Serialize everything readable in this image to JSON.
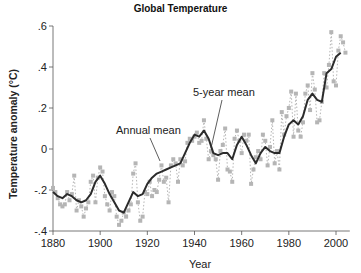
{
  "chart_data": {
    "type": "line",
    "title": "Global Temperature",
    "xlabel": "Year",
    "ylabel": "Temperature anomaly (°C)",
    "xlim": [
      1880,
      2005
    ],
    "ylim": [
      -0.4,
      0.6
    ],
    "x_ticks": [
      1880,
      1900,
      1920,
      1940,
      1960,
      1980,
      2000
    ],
    "x_tick_labels": [
      "1880",
      "1900",
      "1920",
      "1940",
      "1960",
      "1980",
      "2000"
    ],
    "y_ticks": [
      -0.4,
      -0.2,
      0,
      0.2,
      0.4,
      0.6
    ],
    "y_tick_labels": [
      "-.4",
      "-.2",
      "0",
      ".2",
      ".4",
      ".6"
    ],
    "grid": false,
    "legend": null,
    "annotations": [
      {
        "text": "Annual mean",
        "target_series": "Annual mean"
      },
      {
        "text": "5-year mean",
        "target_series": "5-year mean"
      }
    ],
    "series": [
      {
        "name": "5-year mean",
        "style": "solid dark line",
        "color": "#2b2b2b",
        "x": [
          1880,
          1882,
          1884,
          1886,
          1888,
          1890,
          1892,
          1894,
          1896,
          1898,
          1900,
          1902,
          1904,
          1906,
          1908,
          1910,
          1912,
          1914,
          1916,
          1918,
          1920,
          1922,
          1924,
          1926,
          1928,
          1930,
          1932,
          1934,
          1936,
          1938,
          1940,
          1942,
          1944,
          1946,
          1948,
          1950,
          1952,
          1954,
          1956,
          1958,
          1960,
          1962,
          1964,
          1966,
          1968,
          1970,
          1972,
          1974,
          1976,
          1978,
          1980,
          1982,
          1984,
          1986,
          1988,
          1990,
          1992,
          1994,
          1996,
          1998,
          2000,
          2002
        ],
        "values": [
          -0.21,
          -0.23,
          -0.24,
          -0.22,
          -0.23,
          -0.25,
          -0.26,
          -0.25,
          -0.22,
          -0.16,
          -0.13,
          -0.17,
          -0.22,
          -0.26,
          -0.3,
          -0.31,
          -0.26,
          -0.21,
          -0.23,
          -0.22,
          -0.17,
          -0.14,
          -0.12,
          -0.11,
          -0.1,
          -0.09,
          -0.08,
          -0.07,
          -0.02,
          0.03,
          0.07,
          0.06,
          0.09,
          0.05,
          -0.02,
          -0.03,
          -0.02,
          -0.02,
          -0.05,
          0.02,
          0.06,
          0.02,
          -0.03,
          -0.07,
          -0.02,
          0.01,
          -0.01,
          -0.02,
          -0.02,
          0.06,
          0.12,
          0.14,
          0.12,
          0.16,
          0.24,
          0.27,
          0.24,
          0.23,
          0.37,
          0.39,
          0.45,
          0.47
        ]
      },
      {
        "name": "Annual mean",
        "style": "light gray squares with dashed connectors",
        "color": "#b5b5b5",
        "x": [
          1880,
          1881,
          1882,
          1883,
          1884,
          1885,
          1886,
          1887,
          1888,
          1889,
          1890,
          1891,
          1892,
          1893,
          1894,
          1895,
          1896,
          1897,
          1898,
          1899,
          1900,
          1901,
          1902,
          1903,
          1904,
          1905,
          1906,
          1907,
          1908,
          1909,
          1910,
          1911,
          1912,
          1913,
          1914,
          1915,
          1916,
          1917,
          1918,
          1919,
          1920,
          1921,
          1922,
          1923,
          1924,
          1925,
          1926,
          1927,
          1928,
          1929,
          1930,
          1931,
          1932,
          1933,
          1934,
          1935,
          1936,
          1937,
          1938,
          1939,
          1940,
          1941,
          1942,
          1943,
          1944,
          1945,
          1946,
          1947,
          1948,
          1949,
          1950,
          1951,
          1952,
          1953,
          1954,
          1955,
          1956,
          1957,
          1958,
          1959,
          1960,
          1961,
          1962,
          1963,
          1964,
          1965,
          1966,
          1967,
          1968,
          1969,
          1970,
          1971,
          1972,
          1973,
          1974,
          1975,
          1976,
          1977,
          1978,
          1979,
          1980,
          1981,
          1982,
          1983,
          1984,
          1985,
          1986,
          1987,
          1988,
          1989,
          1990,
          1991,
          1992,
          1993,
          1994,
          1995,
          1996,
          1997,
          1998,
          1999,
          2000,
          2001,
          2002,
          2003,
          2004
        ],
        "values": [
          -0.19,
          -0.21,
          -0.24,
          -0.27,
          -0.28,
          -0.27,
          -0.21,
          -0.25,
          -0.22,
          -0.13,
          -0.3,
          -0.25,
          -0.28,
          -0.33,
          -0.29,
          -0.26,
          -0.16,
          -0.13,
          -0.26,
          -0.14,
          -0.09,
          -0.11,
          -0.23,
          -0.27,
          -0.3,
          -0.21,
          -0.23,
          -0.33,
          -0.37,
          -0.35,
          -0.31,
          -0.33,
          -0.3,
          -0.27,
          -0.12,
          -0.07,
          -0.26,
          -0.35,
          -0.33,
          -0.21,
          -0.22,
          -0.16,
          -0.23,
          -0.2,
          -0.21,
          -0.15,
          -0.08,
          -0.16,
          -0.14,
          -0.26,
          -0.08,
          -0.05,
          -0.07,
          -0.16,
          -0.05,
          -0.08,
          -0.06,
          0.03,
          0.05,
          0.04,
          0.06,
          0.08,
          0.03,
          0.04,
          0.14,
          0.05,
          -0.05,
          -0.01,
          -0.03,
          -0.05,
          -0.15,
          -0.01,
          0.02,
          0.1,
          -0.1,
          -0.11,
          -0.16,
          0.05,
          0.09,
          0.04,
          -0.02,
          0.07,
          0.04,
          0.07,
          -0.17,
          -0.1,
          -0.04,
          -0.01,
          -0.05,
          0.07,
          0.04,
          -0.08,
          0.01,
          0.14,
          -0.07,
          -0.01,
          -0.1,
          0.18,
          0.07,
          0.16,
          0.2,
          0.28,
          0.06,
          0.27,
          0.09,
          0.06,
          0.13,
          0.27,
          0.31,
          0.19,
          0.37,
          0.29,
          0.13,
          0.14,
          0.23,
          0.37,
          0.3,
          0.41,
          0.57,
          0.33,
          0.31,
          0.48,
          0.55,
          0.52,
          0.47
        ]
      }
    ]
  },
  "labels": {
    "title": "Global Temperature",
    "xlabel": "Year",
    "ylabel": "Temperature anomaly (°C)",
    "annual_annotation": "Annual mean",
    "fiveyear_annotation": "5-year mean"
  },
  "colors": {
    "five_year_line": "#2b2b2b",
    "annual_points": "#b5b5b5",
    "axis": "#555555"
  }
}
